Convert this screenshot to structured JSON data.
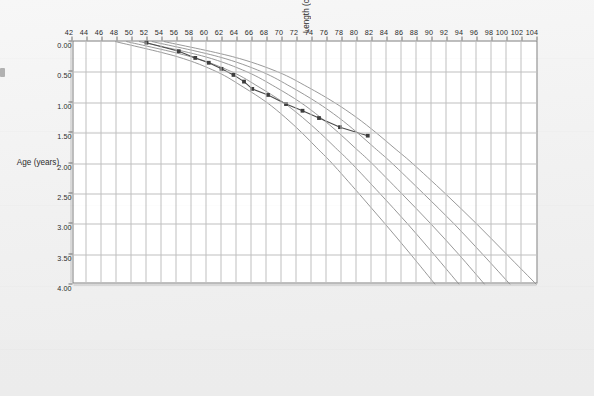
{
  "chart_data": {
    "type": "line",
    "title": "",
    "subtitle": "",
    "xlabel": "Age (years)",
    "ylabel": "Length (cm)",
    "xlim": [
      0.0,
      4.0
    ],
    "ylim": [
      42,
      104
    ],
    "grid": true,
    "legend_position": "none",
    "orientation": "rotated-90",
    "x_ticks": [
      "0.00",
      "0.50",
      "1.00",
      "1.50",
      "2.00",
      "2.50",
      "3.00",
      "3.50",
      "4.00"
    ],
    "x_tick_values": [
      0.0,
      0.5,
      1.0,
      1.5,
      2.0,
      2.5,
      3.0,
      3.5,
      4.0
    ],
    "y_ticks": [
      "104",
      "102",
      "100",
      "98",
      "96",
      "94",
      "92",
      "90",
      "88",
      "86",
      "84",
      "82",
      "80",
      "78",
      "76",
      "74",
      "72",
      "70",
      "68",
      "66",
      "64",
      "62",
      "60",
      "58",
      "56",
      "54",
      "52",
      "50",
      "48",
      "46",
      "44",
      "42"
    ],
    "y_tick_values": [
      104,
      102,
      100,
      98,
      96,
      94,
      92,
      90,
      88,
      86,
      84,
      82,
      80,
      78,
      76,
      74,
      72,
      70,
      68,
      66,
      64,
      62,
      60,
      58,
      56,
      54,
      52,
      50,
      48,
      46,
      44,
      42
    ],
    "series": [
      {
        "name": "97th percentile",
        "type": "reference-curve",
        "color": "#8d8d8d",
        "x": [
          0.0,
          0.25,
          0.5,
          0.75,
          1.0,
          1.25,
          1.5,
          1.75,
          2.0,
          2.5,
          3.0,
          3.5,
          4.0
        ],
        "values": [
          54.3,
          63.5,
          69.5,
          73.5,
          77.0,
          80.0,
          82.6,
          85.0,
          87.4,
          91.8,
          96.0,
          100.0,
          104.0
        ]
      },
      {
        "name": "85th percentile",
        "type": "reference-curve",
        "color": "#8d8d8d",
        "x": [
          0.0,
          0.25,
          0.5,
          0.75,
          1.0,
          1.25,
          1.5,
          1.75,
          2.0,
          2.5,
          3.0,
          3.5,
          4.0
        ],
        "values": [
          52.7,
          61.6,
          67.4,
          71.3,
          74.7,
          77.6,
          80.1,
          82.4,
          84.7,
          88.9,
          93.0,
          96.8,
          100.5
        ]
      },
      {
        "name": "50th percentile",
        "type": "reference-curve",
        "color": "#8d8d8d",
        "x": [
          0.0,
          0.25,
          0.5,
          0.75,
          1.0,
          1.25,
          1.5,
          1.75,
          2.0,
          2.5,
          3.0,
          3.5,
          4.0
        ],
        "values": [
          51.0,
          59.8,
          65.4,
          69.2,
          72.5,
          75.2,
          77.6,
          79.8,
          82.0,
          86.0,
          89.9,
          93.6,
          97.1
        ]
      },
      {
        "name": "15th percentile",
        "type": "reference-curve",
        "color": "#8d8d8d",
        "x": [
          0.0,
          0.25,
          0.5,
          0.75,
          1.0,
          1.25,
          1.5,
          1.75,
          2.0,
          2.5,
          3.0,
          3.5,
          4.0
        ],
        "values": [
          49.3,
          57.9,
          63.4,
          67.0,
          70.2,
          72.8,
          75.1,
          77.2,
          79.3,
          83.1,
          86.8,
          90.3,
          93.7
        ]
      },
      {
        "name": "3rd percentile",
        "type": "reference-curve",
        "color": "#8d8d8d",
        "x": [
          0.0,
          0.25,
          0.5,
          0.75,
          1.0,
          1.25,
          1.5,
          1.75,
          2.0,
          2.5,
          3.0,
          3.5,
          4.0
        ],
        "values": [
          47.8,
          56.1,
          61.4,
          64.9,
          68.0,
          70.5,
          72.7,
          74.7,
          76.7,
          80.3,
          83.8,
          87.2,
          90.5
        ]
      },
      {
        "name": "Patient length measurements",
        "type": "measured",
        "color": "#3d3d3d",
        "marker": "square",
        "x": [
          0.02,
          0.16,
          0.27,
          0.35,
          0.45,
          0.55,
          0.66,
          0.78,
          0.88,
          1.03,
          1.14,
          1.26,
          1.41,
          1.55
        ],
        "values": [
          52.0,
          56.3,
          58.5,
          60.3,
          62.0,
          63.6,
          65.0,
          66.1,
          68.2,
          70.6,
          72.8,
          75.0,
          77.8,
          81.5
        ]
      }
    ]
  },
  "axes": {
    "length_axis_label": "Length (cm)",
    "age_axis_label": "Age (years)"
  }
}
